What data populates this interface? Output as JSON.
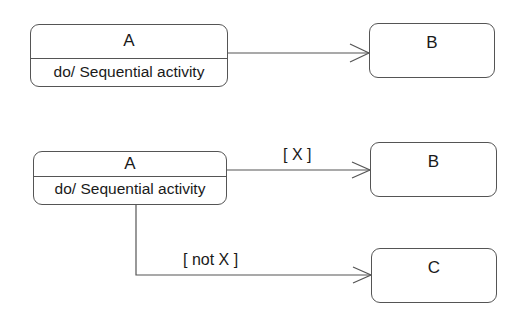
{
  "diagram": {
    "type": "UML state machine",
    "top": {
      "source": {
        "name": "A",
        "activity": "do/ Sequential activity"
      },
      "target": {
        "name": "B"
      },
      "transition": {
        "guard": ""
      }
    },
    "bottom": {
      "source": {
        "name": "A",
        "activity": "do/ Sequential activity"
      },
      "target_true": {
        "name": "B"
      },
      "target_false": {
        "name": "C"
      },
      "guard_true": "[ X ]",
      "guard_false": "[ not X ]"
    }
  },
  "colors": {
    "line": "#555555",
    "text": "#1a1a1a",
    "background": "#ffffff"
  }
}
